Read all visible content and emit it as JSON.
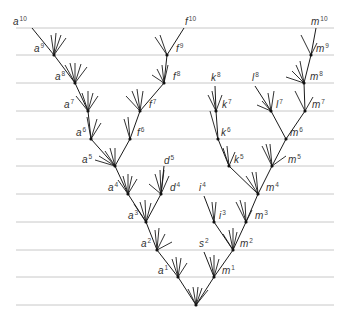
{
  "diagram": {
    "title": "",
    "colors": {
      "generation_line": "#c8c8c8",
      "branch": "#1a1a1a",
      "label": "#333333"
    },
    "generation_lines": {
      "x_start": 16,
      "x_end": 334,
      "y": [
        28,
        55,
        83,
        111,
        139,
        166,
        194,
        222,
        250,
        277,
        305
      ]
    },
    "nodes": [
      {
        "id": "root",
        "x": 196,
        "y": 305,
        "dot": true
      },
      {
        "id": "a1",
        "x": 178,
        "y": 277,
        "dot": true
      },
      {
        "id": "a2",
        "x": 157,
        "y": 250,
        "dot": true
      },
      {
        "id": "a3",
        "x": 146,
        "y": 222,
        "dot": true
      },
      {
        "id": "a4",
        "x": 128,
        "y": 194,
        "dot": true
      },
      {
        "id": "a5",
        "x": 115,
        "y": 166,
        "dot": true
      },
      {
        "id": "a6",
        "x": 91,
        "y": 139,
        "dot": true
      },
      {
        "id": "a7",
        "x": 88,
        "y": 111,
        "dot": true
      },
      {
        "id": "a8",
        "x": 75,
        "y": 83,
        "dot": true
      },
      {
        "id": "a9",
        "x": 54,
        "y": 55,
        "dot": true
      },
      {
        "id": "a10",
        "x": 32,
        "y": 28,
        "dot": false
      },
      {
        "id": "f6",
        "x": 130,
        "y": 139,
        "dot": true
      },
      {
        "id": "f7",
        "x": 140,
        "y": 111,
        "dot": true
      },
      {
        "id": "f8",
        "x": 164,
        "y": 83,
        "dot": true
      },
      {
        "id": "f9",
        "x": 167,
        "y": 55,
        "dot": true
      },
      {
        "id": "f10",
        "x": 184,
        "y": 28,
        "dot": false
      },
      {
        "id": "d4",
        "x": 161,
        "y": 194,
        "dot": true
      },
      {
        "id": "d5",
        "x": 164,
        "y": 166,
        "dot": false
      },
      {
        "id": "m1",
        "x": 214,
        "y": 277,
        "dot": true
      },
      {
        "id": "m2",
        "x": 233,
        "y": 250,
        "dot": true
      },
      {
        "id": "m3",
        "x": 246,
        "y": 222,
        "dot": true
      },
      {
        "id": "m4",
        "x": 258,
        "y": 194,
        "dot": true
      },
      {
        "id": "m5",
        "x": 272,
        "y": 166,
        "dot": true
      },
      {
        "id": "m6",
        "x": 286,
        "y": 139,
        "dot": true
      },
      {
        "id": "m7",
        "x": 305,
        "y": 111,
        "dot": true
      },
      {
        "id": "m8",
        "x": 304,
        "y": 83,
        "dot": true
      },
      {
        "id": "m9",
        "x": 311,
        "y": 55,
        "dot": true
      },
      {
        "id": "m10",
        "x": 316,
        "y": 28,
        "dot": false
      },
      {
        "id": "s2",
        "x": 204,
        "y": 252,
        "dot": false
      },
      {
        "id": "i3",
        "x": 214,
        "y": 222,
        "dot": true
      },
      {
        "id": "i4",
        "x": 204,
        "y": 196,
        "dot": false
      },
      {
        "id": "k5",
        "x": 229,
        "y": 166,
        "dot": true
      },
      {
        "id": "k6",
        "x": 218,
        "y": 139,
        "dot": true
      },
      {
        "id": "k7",
        "x": 216,
        "y": 111,
        "dot": true
      },
      {
        "id": "k8",
        "x": 215,
        "y": 86,
        "dot": false
      },
      {
        "id": "l7",
        "x": 271,
        "y": 111,
        "dot": true
      },
      {
        "id": "l8",
        "x": 255,
        "y": 86,
        "dot": false
      }
    ],
    "edges": [
      [
        "root",
        "a1"
      ],
      [
        "a1",
        "a2"
      ],
      [
        "a2",
        "a3"
      ],
      [
        "a3",
        "a4"
      ],
      [
        "a4",
        "a5"
      ],
      [
        "a5",
        "a6"
      ],
      [
        "a6",
        "a7"
      ],
      [
        "a7",
        "a8"
      ],
      [
        "a8",
        "a9"
      ],
      [
        "a9",
        "a10"
      ],
      [
        "a5",
        "f6"
      ],
      [
        "f6",
        "f7"
      ],
      [
        "f7",
        "f8"
      ],
      [
        "f8",
        "f9"
      ],
      [
        "f9",
        "f10"
      ],
      [
        "a3",
        "d4"
      ],
      [
        "d4",
        "d5"
      ],
      [
        "root",
        "m1"
      ],
      [
        "m1",
        "m2"
      ],
      [
        "m2",
        "m3"
      ],
      [
        "m3",
        "m4"
      ],
      [
        "m4",
        "m5"
      ],
      [
        "m5",
        "m6"
      ],
      [
        "m6",
        "m7"
      ],
      [
        "m7",
        "m8"
      ],
      [
        "m8",
        "m9"
      ],
      [
        "m9",
        "m10"
      ],
      [
        "m1",
        "s2"
      ],
      [
        "m2",
        "i3"
      ],
      [
        "i3",
        "i4"
      ],
      [
        "m4",
        "k5"
      ],
      [
        "k5",
        "k6"
      ],
      [
        "k6",
        "k7"
      ],
      [
        "k7",
        "k8"
      ],
      [
        "m6",
        "l7"
      ],
      [
        "l7",
        "l8"
      ]
    ],
    "stubs": [
      {
        "from": "root",
        "dx": [
          -8,
          -3,
          2,
          6,
          12
        ],
        "dy": [
          -16,
          -18,
          -18,
          -17,
          -15
        ]
      },
      {
        "from": "a1",
        "dx": [
          -6,
          -2,
          3,
          9
        ],
        "dy": [
          -18,
          -20,
          -19,
          -14
        ]
      },
      {
        "from": "a2",
        "dx": [
          -2,
          2,
          8,
          15
        ],
        "dy": [
          -20,
          -22,
          -16,
          -8
        ]
      },
      {
        "from": "a3",
        "dx": [
          -12,
          -6,
          -1,
          5
        ],
        "dy": [
          -18,
          -20,
          -22,
          -19
        ]
      },
      {
        "from": "a4",
        "dx": [
          -10,
          -5,
          0,
          4,
          9
        ],
        "dy": [
          -14,
          -18,
          -20,
          -18,
          -15
        ]
      },
      {
        "from": "a5",
        "dx": [
          -20,
          -16,
          -10,
          -5,
          0
        ],
        "dy": [
          -6,
          -10,
          -15,
          -18,
          -18
        ]
      },
      {
        "from": "a6",
        "dx": [
          -4,
          6,
          10
        ],
        "dy": [
          -22,
          -20,
          -16
        ]
      },
      {
        "from": "a7",
        "dx": [
          -12,
          -6,
          0,
          5,
          10
        ],
        "dy": [
          -15,
          -18,
          -20,
          -18,
          -15
        ]
      },
      {
        "from": "a8",
        "dx": [
          -10,
          -5,
          0,
          6,
          12
        ],
        "dy": [
          -18,
          -20,
          -20,
          -19,
          -16
        ]
      },
      {
        "from": "a9",
        "dx": [
          -3,
          2,
          7,
          12
        ],
        "dy": [
          -20,
          -22,
          -20,
          -17
        ]
      },
      {
        "from": "f6",
        "dx": [
          -6,
          -2
        ],
        "dy": [
          -20,
          -22
        ]
      },
      {
        "from": "f7",
        "dx": [
          -14,
          -8,
          -3,
          3
        ],
        "dy": [
          -15,
          -20,
          -22,
          -20
        ]
      },
      {
        "from": "f8",
        "dx": [
          -12,
          -7,
          -2,
          4
        ],
        "dy": [
          -8,
          -14,
          -18,
          -18
        ]
      },
      {
        "from": "f9",
        "dx": [
          -12,
          -7
        ],
        "dy": [
          -18,
          -20
        ]
      },
      {
        "from": "d4",
        "dx": [
          -12,
          -6,
          -1,
          3,
          8
        ],
        "dy": [
          -10,
          -20,
          -24,
          -24,
          -18
        ]
      },
      {
        "from": "m1",
        "dx": [
          -4,
          0,
          5
        ],
        "dy": [
          -20,
          -22,
          -18
        ]
      },
      {
        "from": "m2",
        "dx": [
          -10,
          -4,
          0,
          4
        ],
        "dy": [
          -16,
          -20,
          -22,
          -18
        ]
      },
      {
        "from": "m3",
        "dx": [
          -10,
          -6,
          -1,
          6
        ],
        "dy": [
          -20,
          -22,
          -20,
          -12
        ]
      },
      {
        "from": "m4",
        "dx": [
          -12,
          -6,
          -2
        ],
        "dy": [
          -18,
          -22,
          -22
        ]
      },
      {
        "from": "m5",
        "dx": [
          -10,
          -6,
          -2,
          14
        ],
        "dy": [
          -20,
          -22,
          -22,
          -10
        ]
      },
      {
        "from": "m7",
        "dx": [
          -10,
          8
        ],
        "dy": [
          -20,
          -14
        ]
      },
      {
        "from": "m8",
        "dx": [
          -18,
          -12,
          -8,
          -4
        ],
        "dy": [
          -6,
          -12,
          -18,
          -22
        ]
      },
      {
        "from": "m9",
        "dx": [
          -10,
          6
        ],
        "dy": [
          -20,
          -12
        ]
      },
      {
        "from": "i3",
        "dx": [
          -2,
          2
        ],
        "dy": [
          -20,
          -20
        ]
      },
      {
        "from": "k5",
        "dx": [
          -6,
          -2,
          6
        ],
        "dy": [
          -18,
          -20,
          -14
        ]
      },
      {
        "from": "k6",
        "dx": [
          -8
        ],
        "dy": [
          -28
        ]
      },
      {
        "from": "k7",
        "dx": [
          -8,
          -4,
          6
        ],
        "dy": [
          -16,
          -20,
          -16
        ]
      },
      {
        "from": "l7",
        "dx": [
          -14,
          -9,
          -3,
          3
        ],
        "dy": [
          -6,
          -10,
          -18,
          -20
        ]
      }
    ],
    "labels": [
      {
        "base": "a",
        "sup": "10",
        "x": 13,
        "y": 25
      },
      {
        "base": "a",
        "sup": "9",
        "x": 34,
        "y": 52
      },
      {
        "base": "a",
        "sup": "8",
        "x": 55,
        "y": 80
      },
      {
        "base": "a",
        "sup": "7",
        "x": 64,
        "y": 108
      },
      {
        "base": "a",
        "sup": "6",
        "x": 76,
        "y": 136
      },
      {
        "base": "a",
        "sup": "5",
        "x": 82,
        "y": 163
      },
      {
        "base": "a",
        "sup": "4",
        "x": 108,
        "y": 191
      },
      {
        "base": "a",
        "sup": "3",
        "x": 128,
        "y": 219
      },
      {
        "base": "a",
        "sup": "2",
        "x": 141,
        "y": 247
      },
      {
        "base": "a",
        "sup": "1",
        "x": 158,
        "y": 274
      },
      {
        "base": "f",
        "sup": "10",
        "x": 185,
        "y": 25
      },
      {
        "base": "f",
        "sup": "9",
        "x": 176,
        "y": 52
      },
      {
        "base": "f",
        "sup": "8",
        "x": 173,
        "y": 80
      },
      {
        "base": "f",
        "sup": "7",
        "x": 149,
        "y": 108
      },
      {
        "base": "f",
        "sup": "6",
        "x": 137,
        "y": 136
      },
      {
        "base": "d",
        "sup": "5",
        "x": 164,
        "y": 164
      },
      {
        "base": "d",
        "sup": "4",
        "x": 170,
        "y": 191
      },
      {
        "base": "k",
        "sup": "8",
        "x": 211,
        "y": 81
      },
      {
        "base": "k",
        "sup": "7",
        "x": 222,
        "y": 108
      },
      {
        "base": "k",
        "sup": "6",
        "x": 221,
        "y": 136
      },
      {
        "base": "k",
        "sup": "5",
        "x": 234,
        "y": 163
      },
      {
        "base": "l",
        "sup": "8",
        "x": 252,
        "y": 81
      },
      {
        "base": "l",
        "sup": "7",
        "x": 276,
        "y": 108
      },
      {
        "base": "m",
        "sup": "10",
        "x": 311,
        "y": 25
      },
      {
        "base": "m",
        "sup": "9",
        "x": 316,
        "y": 52
      },
      {
        "base": "m",
        "sup": "8",
        "x": 310,
        "y": 80
      },
      {
        "base": "m",
        "sup": "7",
        "x": 312,
        "y": 108
      },
      {
        "base": "m",
        "sup": "6",
        "x": 290,
        "y": 136
      },
      {
        "base": "m",
        "sup": "5",
        "x": 288,
        "y": 163
      },
      {
        "base": "m",
        "sup": "4",
        "x": 266,
        "y": 191
      },
      {
        "base": "m",
        "sup": "3",
        "x": 255,
        "y": 219
      },
      {
        "base": "m",
        "sup": "2",
        "x": 240,
        "y": 247
      },
      {
        "base": "m",
        "sup": "1",
        "x": 222,
        "y": 274
      },
      {
        "base": "i",
        "sup": "4",
        "x": 199,
        "y": 191
      },
      {
        "base": "i",
        "sup": "3",
        "x": 219,
        "y": 219
      },
      {
        "base": "s",
        "sup": "2",
        "x": 199,
        "y": 247
      }
    ]
  }
}
